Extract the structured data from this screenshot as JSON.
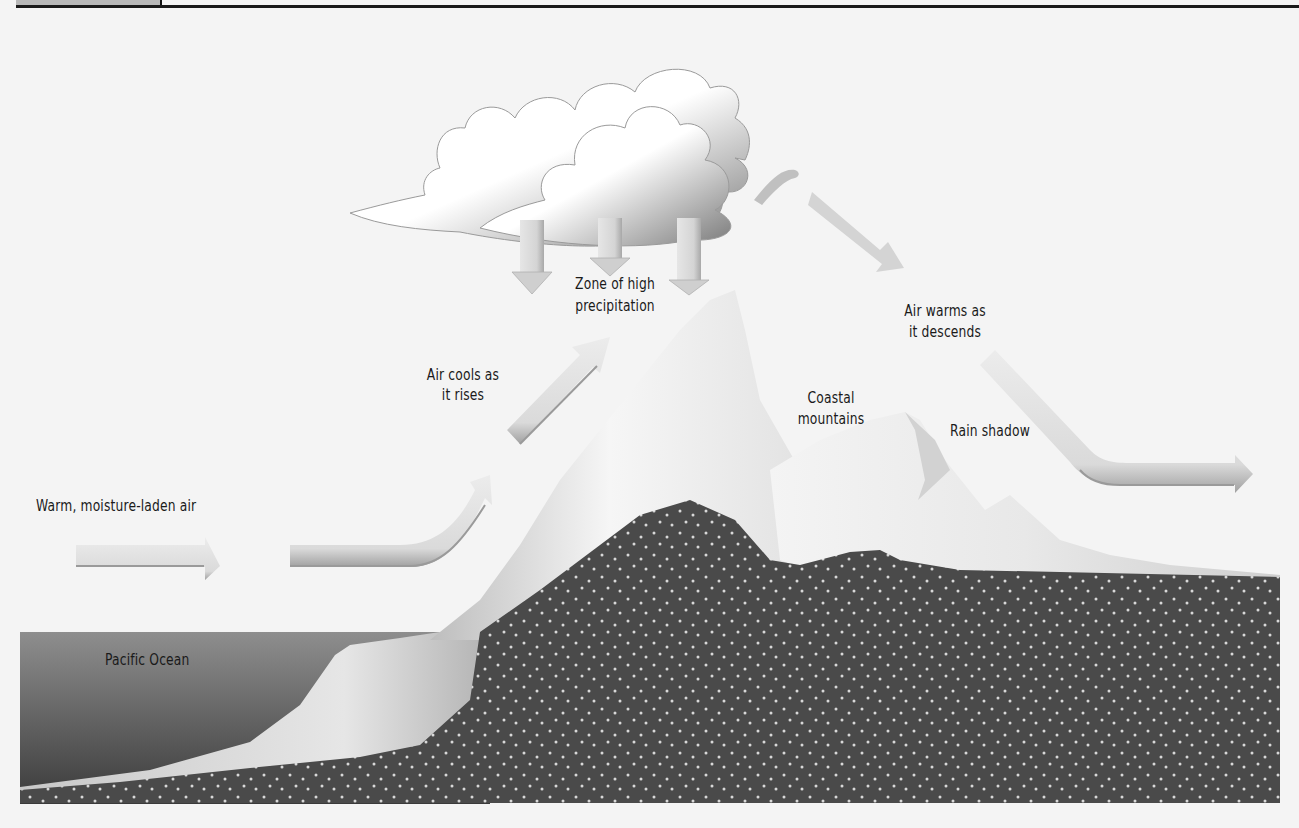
{
  "header": {
    "tab_label": "",
    "rule_color": "#1a1a1a"
  },
  "diagram": {
    "colors": {
      "background": "#f4f4f4",
      "ground": "#4a4a4a",
      "ground_dots": "#d8d8d8",
      "ocean_top": "#8a8a8a",
      "ocean_bottom": "#3c3c3c",
      "mountain_light": "#f2f2f2",
      "mountain_shade": "#c4c4c4",
      "arrow_fill": "#d6d6d6",
      "arrow_shade": "#a8a8a8",
      "cloud_fill": "#ffffff",
      "cloud_shade": "#8c8c8c",
      "text": "#1a1a1a"
    },
    "labels": {
      "warm_air": "Warm, moisture-laden air",
      "air_cools_line1": "Air cools as",
      "air_cools_line2": "it rises",
      "zone_line1": "Zone of high",
      "zone_line2": "precipitation",
      "air_warms_line1": "Air warms as",
      "air_warms_line2": "it descends",
      "coastal_line1": "Coastal",
      "coastal_line2": "mountains",
      "rain_shadow": "Rain shadow",
      "ocean": "Pacific Ocean"
    },
    "elements": {
      "clouds": 1,
      "precipitation_arrows": 3,
      "air_flow_arrows": 6
    }
  }
}
